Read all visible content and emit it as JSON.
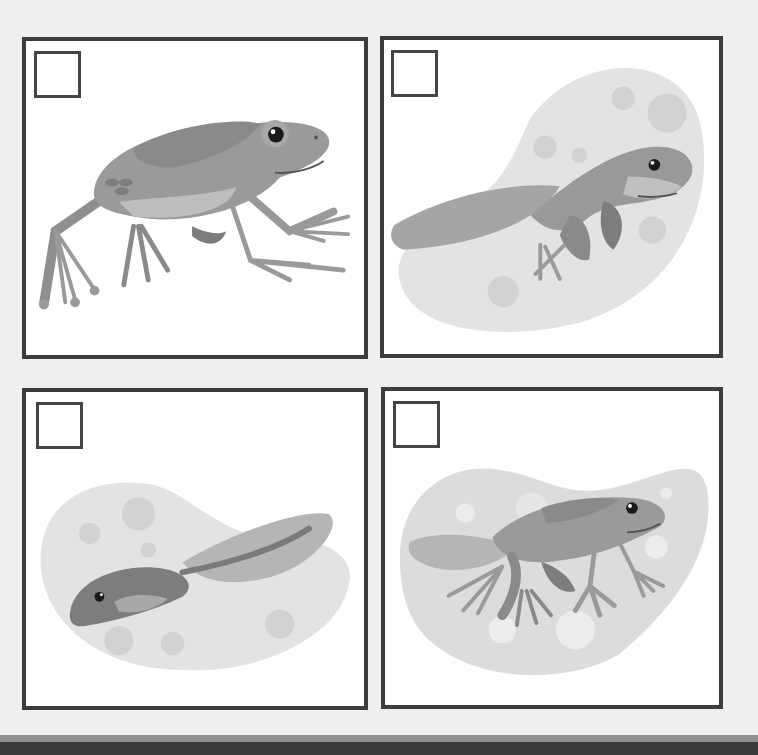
{
  "worksheet": {
    "panels": [
      {
        "id": 1,
        "stage": "adult-frog",
        "checkbox_checked": false,
        "icon": "adult-frog-icon"
      },
      {
        "id": 2,
        "stage": "tadpole-with-legs",
        "checkbox_checked": false,
        "icon": "tadpole-with-legs-icon"
      },
      {
        "id": 3,
        "stage": "tadpole",
        "checkbox_checked": false,
        "icon": "tadpole-icon"
      },
      {
        "id": 4,
        "stage": "froglet",
        "checkbox_checked": false,
        "icon": "froglet-icon"
      }
    ]
  },
  "colors": {
    "background": "#efefef",
    "panel_border": "#3c3c3c",
    "frog_body": "#9a9a9a",
    "frog_dark": "#7d7d7d",
    "frog_belly": "#bdbdbd",
    "water": "#e3e3e3",
    "bubble": "#d2d2d2"
  }
}
